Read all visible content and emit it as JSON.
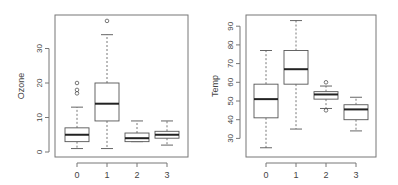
{
  "chart_data": [
    {
      "type": "box",
      "title": "",
      "xlabel": "",
      "ylabel": "Ozone",
      "categories": [
        "0",
        "1",
        "2",
        "3"
      ],
      "yticks": [
        0,
        10,
        20,
        30
      ],
      "ylim": [
        -1,
        40
      ],
      "grid": false,
      "legend": null,
      "boxes": [
        {
          "category": "0",
          "whisker_low": 1,
          "q1": 3,
          "median": 5,
          "q3": 7,
          "whisker_high": 13,
          "outliers": [
            17,
            18,
            20
          ]
        },
        {
          "category": "1",
          "whisker_low": 1,
          "q1": 9,
          "median": 14,
          "q3": 20,
          "whisker_high": 34,
          "outliers": [
            38
          ]
        },
        {
          "category": "2",
          "whisker_low": 3,
          "q1": 3,
          "median": 4,
          "q3": 5.5,
          "whisker_high": 9,
          "outliers": []
        },
        {
          "category": "3",
          "whisker_low": 2,
          "q1": 4,
          "median": 5,
          "q3": 6,
          "whisker_high": 9,
          "outliers": []
        }
      ]
    },
    {
      "type": "box",
      "title": "",
      "xlabel": "",
      "ylabel": "Temp",
      "categories": [
        "0",
        "1",
        "2",
        "3"
      ],
      "yticks": [
        30,
        40,
        50,
        60,
        70,
        80,
        90
      ],
      "ylim": [
        22,
        96
      ],
      "grid": false,
      "legend": null,
      "boxes": [
        {
          "category": "0",
          "whisker_low": 25,
          "q1": 41,
          "median": 51,
          "q3": 59,
          "whisker_high": 77,
          "outliers": []
        },
        {
          "category": "1",
          "whisker_low": 35,
          "q1": 59,
          "median": 67,
          "q3": 77,
          "whisker_high": 93,
          "outliers": []
        },
        {
          "category": "2",
          "whisker_low": 46,
          "q1": 51,
          "median": 53.5,
          "q3": 55,
          "whisker_high": 58,
          "outliers": [
            45,
            60
          ]
        },
        {
          "category": "3",
          "whisker_low": 34,
          "q1": 40,
          "median": 45.5,
          "q3": 48,
          "whisker_high": 52,
          "outliers": []
        }
      ]
    }
  ],
  "plots": [
    {
      "ylabel": "Ozone",
      "yticks": [
        "0",
        "10",
        "20",
        "30"
      ],
      "xticks": [
        "0",
        "1",
        "2",
        "3"
      ]
    },
    {
      "ylabel": "Temp",
      "yticks": [
        "30",
        "40",
        "50",
        "60",
        "70",
        "80",
        "90"
      ],
      "xticks": [
        "0",
        "1",
        "2",
        "3"
      ]
    }
  ]
}
